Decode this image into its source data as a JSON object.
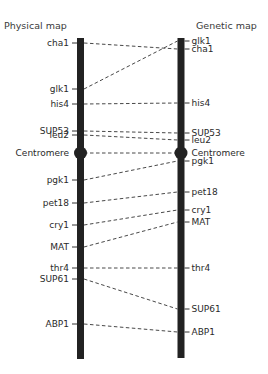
{
  "titles": {
    "physical": "Physical map",
    "genetic": "Genetic map"
  },
  "colors": {
    "bar": "#222222",
    "line": "#333333",
    "text": "#2a2a2a"
  },
  "physical_map": {
    "bar": {
      "x": 80.5,
      "top": 38,
      "bottom": 359,
      "width": 7
    },
    "markers": [
      {
        "name": "cha1",
        "y": 43
      },
      {
        "name": "glk1",
        "y": 89
      },
      {
        "name": "his4",
        "y": 104
      },
      {
        "name": "SUP53",
        "y": 131
      },
      {
        "name": "leu2",
        "y": 135
      },
      {
        "name": "Centromere",
        "y": 153
      },
      {
        "name": "pgk1",
        "y": 180
      },
      {
        "name": "pet18",
        "y": 203
      },
      {
        "name": "cry1",
        "y": 225
      },
      {
        "name": "MAT",
        "y": 247
      },
      {
        "name": "thr4",
        "y": 268
      },
      {
        "name": "SUP61",
        "y": 279
      },
      {
        "name": "ABP1",
        "y": 324
      }
    ]
  },
  "genetic_map": {
    "bar": {
      "x": 181,
      "top": 38,
      "bottom": 358,
      "width": 7
    },
    "markers": [
      {
        "name": "glk1",
        "y": 41
      },
      {
        "name": "cha1",
        "y": 49
      },
      {
        "name": "his4",
        "y": 103
      },
      {
        "name": "SUP53",
        "y": 133
      },
      {
        "name": "leu2",
        "y": 140
      },
      {
        "name": "Centromere",
        "y": 153
      },
      {
        "name": "pgk1",
        "y": 161
      },
      {
        "name": "pet18",
        "y": 192
      },
      {
        "name": "cry1",
        "y": 210
      },
      {
        "name": "MAT",
        "y": 222
      },
      {
        "name": "thr4",
        "y": 268
      },
      {
        "name": "SUP61",
        "y": 309
      },
      {
        "name": "ABP1",
        "y": 332
      }
    ]
  },
  "connections": [
    [
      "cha1",
      "cha1"
    ],
    [
      "glk1",
      "glk1"
    ],
    [
      "his4",
      "his4"
    ],
    [
      "SUP53",
      "SUP53"
    ],
    [
      "leu2",
      "leu2"
    ],
    [
      "Centromere",
      "Centromere"
    ],
    [
      "pgk1",
      "pgk1"
    ],
    [
      "pet18",
      "pet18"
    ],
    [
      "cry1",
      "cry1"
    ],
    [
      "MAT",
      "MAT"
    ],
    [
      "thr4",
      "thr4"
    ],
    [
      "SUP61",
      "SUP61"
    ],
    [
      "ABP1",
      "ABP1"
    ]
  ]
}
